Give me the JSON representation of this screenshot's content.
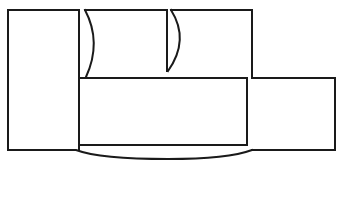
{
  "diagram": {
    "title": "",
    "type": "line-drawing-floor-outline",
    "stroke_color": "#1a1a1a",
    "background": "#ffffff",
    "shapes": [
      {
        "name": "left-block",
        "kind": "rect",
        "x": 8,
        "y": 10,
        "w": 71,
        "h": 140
      },
      {
        "name": "inner-block",
        "kind": "rect",
        "x": 79,
        "y": 78,
        "w": 168,
        "h": 67
      },
      {
        "name": "upper-middle-piece",
        "kind": "path"
      },
      {
        "name": "upper-right-piece",
        "kind": "path"
      },
      {
        "name": "right-wing",
        "kind": "path"
      },
      {
        "name": "bottom-curve",
        "kind": "path"
      }
    ]
  }
}
